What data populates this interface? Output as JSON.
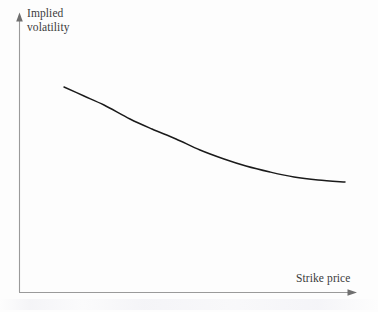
{
  "figure": {
    "background_color": "#fdfdfd",
    "axis_color": "#999999",
    "curve_color": "#1a1a1a",
    "text_color": "#3b3b3b",
    "width": 378,
    "height": 312
  },
  "labels": {
    "y_line1": "Implied",
    "y_line2": "volatility",
    "x": "Strike price"
  },
  "chart_data": {
    "type": "line",
    "title": "",
    "subtitle": "",
    "xlabel": "Strike price",
    "ylabel": "Implied volatility",
    "grid": false,
    "legend": null,
    "axis_style": {
      "x_axis": "arrow-right",
      "y_axis": "arrow-up",
      "ticks": "none",
      "tick_labels": "none",
      "spines": [
        "left",
        "bottom"
      ]
    },
    "xlim": [
      0,
      1
    ],
    "ylim": [
      0,
      1
    ],
    "annotations": [],
    "series": [
      {
        "name": "Implied volatility skew",
        "shape": "monotonically decreasing, convex, flattening to the right",
        "x": [
          0.13,
          0.2,
          0.26,
          0.33,
          0.4,
          0.46,
          0.53,
          0.6,
          0.66,
          0.74,
          0.81,
          0.88,
          0.96
        ],
        "y": [
          0.74,
          0.69,
          0.65,
          0.61,
          0.57,
          0.53,
          0.5,
          0.47,
          0.44,
          0.41,
          0.39,
          0.38,
          0.37
        ],
        "points_px": [
          [
            64,
            87
          ],
          [
            84,
            96
          ],
          [
            104,
            105
          ],
          [
            130,
            119
          ],
          [
            152,
            129
          ],
          [
            176,
            139
          ],
          [
            200,
            150
          ],
          [
            224,
            159
          ],
          [
            246,
            166
          ],
          [
            270,
            172
          ],
          [
            294,
            177
          ],
          [
            318,
            180
          ],
          [
            345,
            182
          ]
        ]
      }
    ]
  }
}
